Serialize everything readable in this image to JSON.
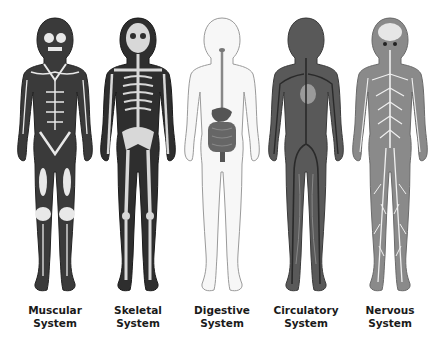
{
  "figures": [
    {
      "id": "muscular",
      "line1": "Muscular",
      "line2": "System",
      "fill": "#3a3a3a",
      "accent": "#e8e8e8"
    },
    {
      "id": "skeletal",
      "line1": "Skeletal",
      "line2": "System",
      "fill": "#2e2e2e",
      "accent": "#d8d8d8"
    },
    {
      "id": "digestive",
      "line1": "Digestive",
      "line2": "System",
      "fill": "#f7f7f7",
      "accent": "#555555"
    },
    {
      "id": "circulatory",
      "line1": "Circulatory",
      "line2": "System",
      "fill": "#595959",
      "accent": "#2a2a2a"
    },
    {
      "id": "nervous",
      "line1": "Nervous",
      "line2": "System",
      "fill": "#8a8a8a",
      "accent": "#f0f0f0"
    }
  ],
  "colors": {
    "background": "#ffffff",
    "label_text": "#1a1a1a",
    "outline": "#9a9a9a"
  }
}
